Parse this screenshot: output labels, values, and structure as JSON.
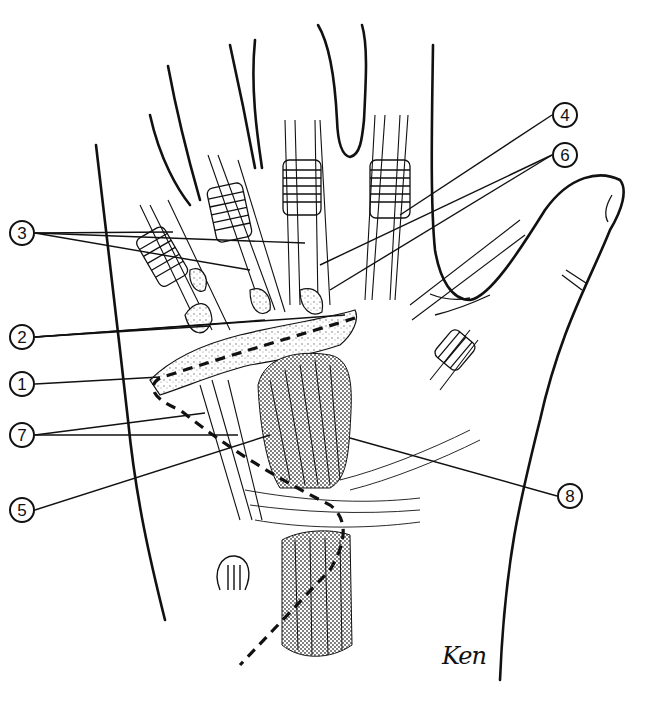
{
  "figure": {
    "type": "anatomical-illustration",
    "signature": "Ken",
    "colors": {
      "ink": "#111111",
      "background": "#ffffff",
      "stipple": "#555555"
    }
  },
  "callouts": [
    {
      "id": "3",
      "label": "3",
      "x": 9,
      "y": 220,
      "targets": [
        [
          173,
          232
        ],
        [
          305,
          243
        ],
        [
          250,
          270
        ]
      ]
    },
    {
      "id": "2",
      "label": "2",
      "x": 9,
      "y": 324,
      "targets": [
        [
          210,
          326
        ],
        [
          345,
          315
        ],
        [
          265,
          320
        ]
      ]
    },
    {
      "id": "1",
      "label": "1",
      "x": 9,
      "y": 371,
      "targets": [
        [
          160,
          377
        ]
      ]
    },
    {
      "id": "7",
      "label": "7",
      "x": 9,
      "y": 422,
      "targets": [
        [
          205,
          413
        ],
        [
          238,
          435
        ]
      ]
    },
    {
      "id": "5",
      "label": "5",
      "x": 9,
      "y": 497,
      "targets": [
        [
          270,
          435
        ]
      ]
    },
    {
      "id": "4",
      "label": "4",
      "x": 552,
      "y": 102,
      "targets": [
        [
          400,
          215
        ]
      ]
    },
    {
      "id": "6",
      "label": "6",
      "x": 552,
      "y": 142,
      "targets": [
        [
          320,
          265
        ],
        [
          330,
          290
        ]
      ]
    },
    {
      "id": "8",
      "label": "8",
      "x": 557,
      "y": 483,
      "targets": [
        [
          350,
          438
        ]
      ]
    }
  ]
}
